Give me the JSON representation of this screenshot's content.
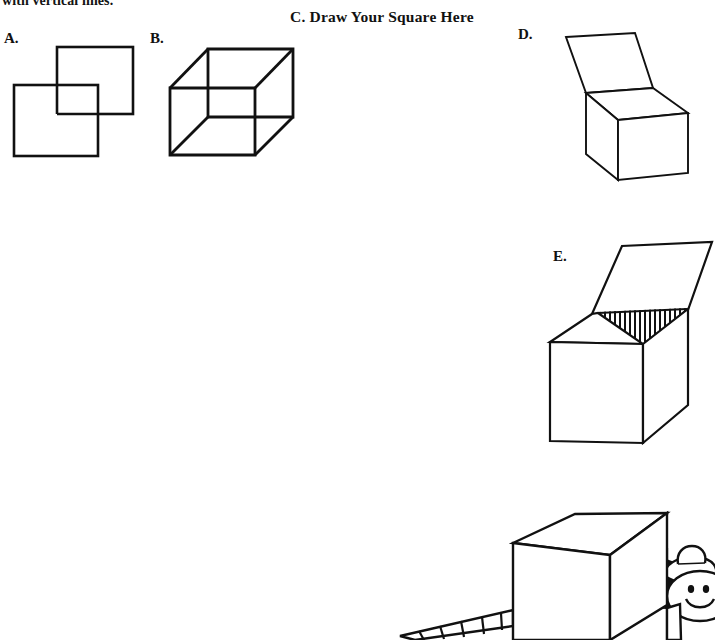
{
  "page": {
    "background_color": "#ffffff",
    "ink_color": "#111111",
    "width": 712,
    "height": 634,
    "clipped_heading": "with vertical lines.",
    "worksheet_type": "drawing-exercise"
  },
  "figures": [
    {
      "id": "A",
      "label": "A.",
      "caption": "",
      "kind": "two-overlapping-squares",
      "label_x": 4,
      "label_y": 30
    },
    {
      "id": "B",
      "label": "B.",
      "caption": "",
      "kind": "wireframe-cube",
      "label_x": 150,
      "label_y": 30
    },
    {
      "id": "C",
      "label": "C. Draw Your Square Here",
      "caption": "C. Draw Your Square Here",
      "kind": "empty-drawing-area",
      "label_x": 290,
      "label_y": 8
    },
    {
      "id": "D",
      "label": "D.",
      "caption": "",
      "kind": "box-with-open-lid",
      "label_x": 518,
      "label_y": 26
    },
    {
      "id": "E",
      "label": "E.",
      "caption": "",
      "kind": "open-box-with-shaded-interior",
      "label_x": 553,
      "label_y": 248
    },
    {
      "id": "F",
      "label": "",
      "caption": "",
      "kind": "box-with-cartoon-figure-and-ramp",
      "label_x": 0,
      "label_y": 0
    }
  ]
}
